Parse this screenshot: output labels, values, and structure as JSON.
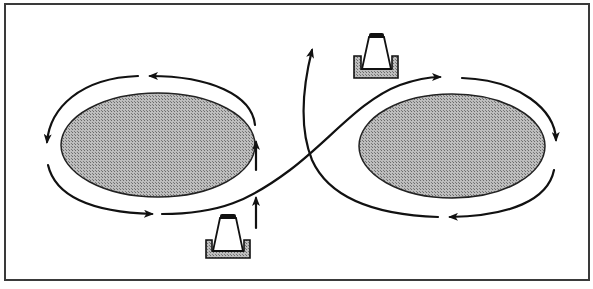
{
  "diagram": {
    "type": "figure-eight traffic pattern around two obstacles",
    "colors": {
      "background": "#ffffff",
      "frame": "#3a3a3a",
      "stroke": "#111111",
      "obstacle_fill": "#a9a9a9",
      "cone_fill": "#ffffff",
      "cone_base_fill": "#b5b5b5",
      "cone_cap": "#111111"
    },
    "obstacles": [
      {
        "name": "left-obstacle",
        "cx": 158,
        "cy": 145,
        "rx": 97,
        "ry": 52
      },
      {
        "name": "right-obstacle",
        "cx": 452,
        "cy": 146,
        "rx": 93,
        "ry": 52
      }
    ],
    "cones": [
      {
        "name": "cone-bottom",
        "x": 204,
        "y": 213
      },
      {
        "name": "cone-top",
        "x": 354,
        "y": 32
      }
    ]
  }
}
